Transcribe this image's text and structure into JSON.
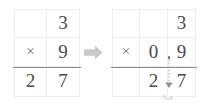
{
  "figure": {
    "colors": {
      "grid_line": "#ececec",
      "answer_rule": "#8c8c8c",
      "digit": "#4a4a4a",
      "operator": "#6e6e6e",
      "arrow": "#c9c9c9",
      "carry_arrow": "#9a9a9a",
      "background": "#ffffff"
    }
  },
  "left_problem": {
    "name": "whole-number-multiplication",
    "columns": 2,
    "rows": 3,
    "expression": "3 x 9 = 27",
    "cells": [
      [
        {
          "text": "",
          "kind": "blank"
        },
        {
          "text": "3",
          "kind": "digit"
        }
      ],
      [
        {
          "text": "×",
          "kind": "operator"
        },
        {
          "text": "9",
          "kind": "digit"
        }
      ],
      [
        {
          "text": "2",
          "kind": "digit"
        },
        {
          "text": "7",
          "kind": "digit"
        }
      ]
    ]
  },
  "transform_arrow": {
    "name": "transform-arrow",
    "direction": "right",
    "label": "becomes"
  },
  "right_problem": {
    "name": "decimal-multiplication",
    "columns": 3,
    "rows": 3,
    "expression": "0.9 x 3 = 2.7",
    "cells": [
      [
        {
          "text": "",
          "kind": "blank"
        },
        {
          "text": "",
          "kind": "blank"
        },
        {
          "text": "3",
          "kind": "digit"
        }
      ],
      [
        {
          "text": "×",
          "kind": "operator"
        },
        {
          "text": "0",
          "kind": "digit"
        },
        {
          "text": "9",
          "kind": "digit"
        }
      ],
      [
        {
          "text": "",
          "kind": "blank"
        },
        {
          "text": "2",
          "kind": "digit"
        },
        {
          "text": "7",
          "kind": "digit"
        }
      ]
    ],
    "decimal_point": {
      "name": "decimal-point",
      "glyph": ".",
      "in_factor": "between 0 and 9",
      "in_product": "between 2 and 7"
    },
    "carry_arrow": {
      "name": "decimal-carry-arrow",
      "style": "dotted",
      "direction": "down",
      "from": "decimal point of factor 0.9",
      "to": "decimal point of product 2.7"
    }
  }
}
